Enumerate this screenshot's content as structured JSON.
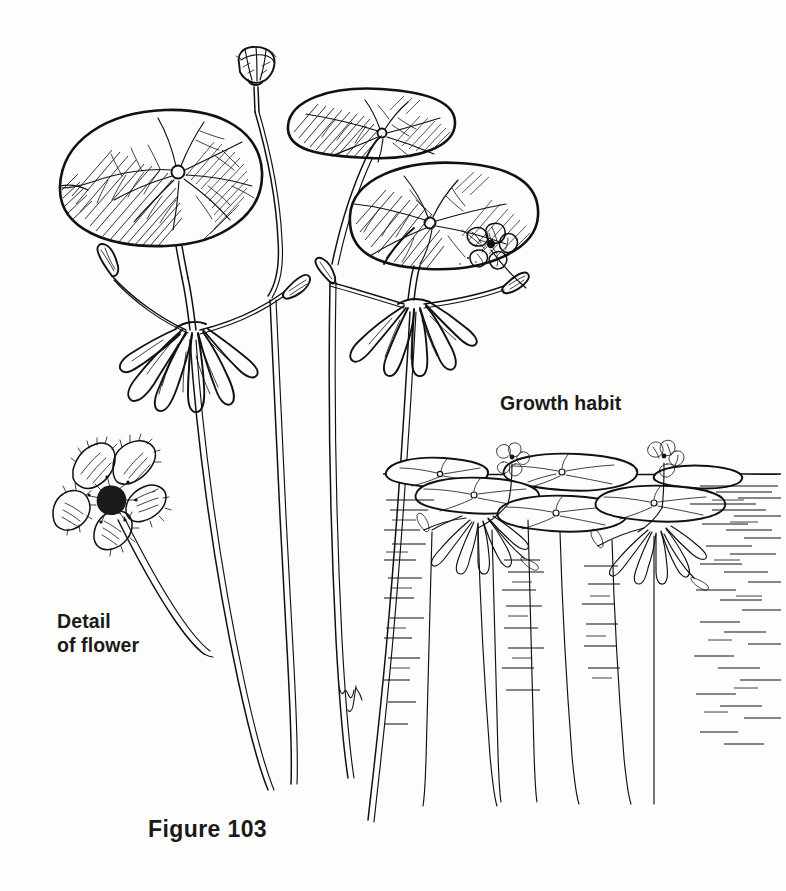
{
  "page": {
    "width": 786,
    "height": 891,
    "background_color": "#fdfdfb",
    "ink_color": "#111111",
    "medium": "pen-and-ink line drawing"
  },
  "labels": {
    "growth_habit": "Growth habit",
    "detail_of_flower": "Detail\nof flower",
    "figure_caption": "Figure 103"
  },
  "signature": {
    "monogram": "WH"
  },
  "illustration": {
    "panels": [
      {
        "name": "main-plant-left",
        "description": "peltate floating leaf on long petiole with umbel node of tuberous roots, pedicels and buds"
      },
      {
        "name": "main-plant-right",
        "description": "two overlapping floating leaves with basal sinus, small open flower on lower leaf, umbel node below"
      },
      {
        "name": "flower-detail",
        "description": "enlarged five-petaled flower with fringed petal margins on a short pedicel"
      },
      {
        "name": "growth-habit-scene",
        "description": "pond cross-section: floating pads at the waterline, flowers held above water, long submerged stems descending"
      }
    ],
    "waterline": {
      "y": 474,
      "x_start": 383,
      "x_end": 781
    },
    "leaf_count_main": 3,
    "leaf_count_habit": 6,
    "stem_count_habit": 5,
    "flower_count_total": 6
  }
}
